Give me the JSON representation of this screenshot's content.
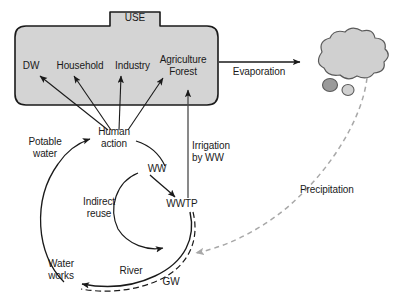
{
  "diagram": {
    "colors": {
      "box_fill": "#d4d4d4",
      "box_stroke": "#1a1a1a",
      "cloud_fill": "#d0d0d0",
      "cloud_stroke": "#5a5a5a",
      "droplet_dark_fill": "#9a9a9a",
      "droplet_light_fill": "#d0d0d0",
      "arrow": "#1a1a1a",
      "precipitation": "#a8a8a8",
      "text": "#1a1a1a",
      "background": "#ffffff"
    },
    "use_box": {
      "tab_label": "USE",
      "sectors": [
        {
          "id": "dw",
          "label": "DW"
        },
        {
          "id": "household",
          "label": "Household"
        },
        {
          "id": "industry",
          "label": "Industry"
        },
        {
          "id": "agriculture-forest",
          "label": "Agriculture\nForest"
        }
      ]
    },
    "nodes": [
      {
        "id": "human-action",
        "label": "Human\naction"
      },
      {
        "id": "potable-water",
        "label": "Potable\nwater"
      },
      {
        "id": "ww",
        "label": "WW"
      },
      {
        "id": "wwtp",
        "label": "WWTP"
      },
      {
        "id": "indirect-reuse",
        "label": "Indirect\nreuse"
      },
      {
        "id": "water-works",
        "label": "Water\nworks"
      },
      {
        "id": "river",
        "label": "River"
      },
      {
        "id": "gw",
        "label": "GW"
      }
    ],
    "flows": [
      {
        "id": "evaporation",
        "label": "Evaporation",
        "style": "solid",
        "from": "use",
        "to": "cloud"
      },
      {
        "id": "precipitation",
        "label": "Precipitation",
        "style": "dashed",
        "from": "cloud",
        "to": "river"
      },
      {
        "id": "irrigation-by-ww",
        "label": "Irrigation\nby WW",
        "style": "solid",
        "from": "wwtp",
        "to": "agriculture-forest"
      }
    ],
    "cloud": {
      "label": "cloud"
    }
  }
}
